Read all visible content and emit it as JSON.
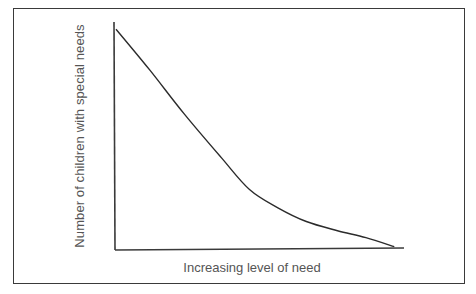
{
  "chart_data": {
    "type": "line",
    "title": "",
    "xlabel": "Increasing level of need",
    "ylabel": "Number of children with special needs",
    "grid": false,
    "legend": null,
    "xticks": [],
    "yticks": [],
    "series": [
      {
        "name": "Number of children",
        "x": [
          0.0,
          0.12,
          0.24,
          0.37,
          0.47,
          0.57,
          0.67,
          0.78,
          0.88,
          0.98
        ],
        "y": [
          0.96,
          0.78,
          0.59,
          0.4,
          0.26,
          0.18,
          0.12,
          0.08,
          0.05,
          0.01
        ]
      }
    ],
    "xlim": [
      0,
      1
    ],
    "ylim": [
      0,
      1
    ]
  },
  "axes": {
    "x_label": "Increasing level of need",
    "y_label": "Number of children with special needs"
  },
  "colors": {
    "line": "#2b2b2b",
    "axis": "#3a3a3a",
    "text": "#555555",
    "frame": "#3a3a3a"
  }
}
